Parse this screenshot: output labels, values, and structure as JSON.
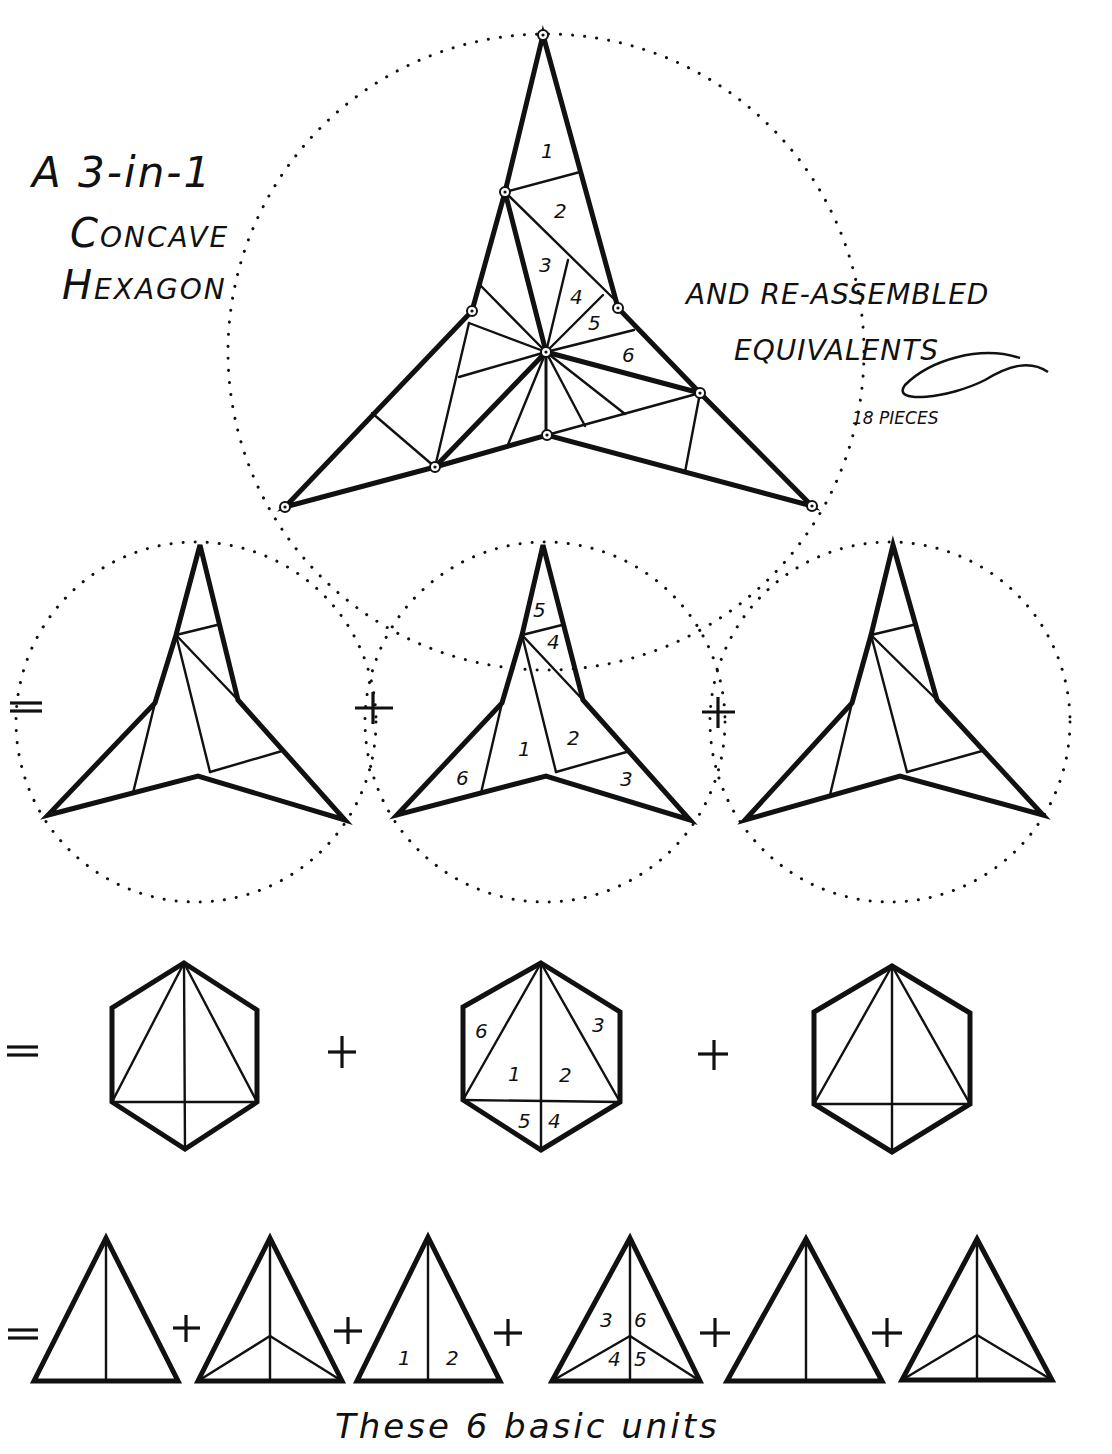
{
  "title": {
    "line1": "A 3-in-1",
    "line2": "Concave",
    "line3": "Hexagon"
  },
  "subtitle": {
    "line1": "And re-assembled",
    "line2": "equivalents",
    "pieces": "18 pieces"
  },
  "main_figure": {
    "labels": [
      "1",
      "2",
      "3",
      "4",
      "5",
      "6"
    ]
  },
  "row1": {
    "operators": [
      "=",
      "+",
      "+"
    ],
    "middle_labels": [
      "5",
      "4",
      "1",
      "2",
      "6",
      "3"
    ]
  },
  "row2": {
    "operators": [
      "=",
      "+",
      "+"
    ],
    "middle_labels": [
      "6",
      "3",
      "1",
      "2",
      "5",
      "4"
    ]
  },
  "row3": {
    "operators": [
      "=",
      "+",
      "+",
      "+",
      "+",
      "+"
    ],
    "unit3_labels": [
      "1",
      "2"
    ],
    "unit4_labels": [
      "3",
      "6",
      "4",
      "5"
    ]
  },
  "caption": {
    "line1": "These 6 basic units"
  }
}
